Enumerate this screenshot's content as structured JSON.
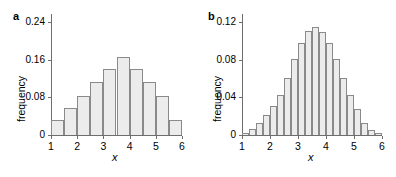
{
  "figure": {
    "background": "#ffffff",
    "bar_fill": "#ececec",
    "bar_stroke": "#8a8a8a",
    "axis_color": "#6e6e6e"
  },
  "panels": [
    {
      "key": "a",
      "label": "a",
      "xlabel": "x",
      "ylabel": "frequency"
    },
    {
      "key": "b",
      "label": "b",
      "xlabel": "x",
      "ylabel": "frequency"
    }
  ],
  "chart_data": [
    {
      "type": "bar",
      "panel": "a",
      "title": "a",
      "xlabel": "x",
      "ylabel": "frequency",
      "xlim": [
        1,
        6
      ],
      "ylim": [
        0,
        0.24
      ],
      "xticks": [
        1,
        2,
        3,
        4,
        5,
        6
      ],
      "xtick_labels": [
        "1",
        "2",
        "3",
        "4",
        "5",
        "6"
      ],
      "yticks": [
        0,
        0.08,
        0.16,
        0.24
      ],
      "ytick_labels": [
        "0",
        "0.08",
        "0.16",
        "0.24"
      ],
      "grid": false,
      "legend": null,
      "bin_width": 0.5,
      "bin_edges": [
        1.0,
        1.5,
        2.0,
        2.5,
        3.0,
        3.5,
        4.0,
        4.5,
        5.0,
        5.5,
        6.0
      ],
      "bin_centers": [
        1.25,
        1.75,
        2.25,
        2.75,
        3.25,
        3.75,
        4.25,
        4.75,
        5.25,
        5.75
      ],
      "categories": [
        "1.0-1.5",
        "1.5-2.0",
        "2.0-2.5",
        "2.5-3.0",
        "3.0-3.5",
        "3.5-4.0",
        "4.0-4.5",
        "4.5-5.0",
        "5.0-5.5",
        "5.5-6.0"
      ],
      "values": [
        0.032,
        0.057,
        0.082,
        0.112,
        0.141,
        0.166,
        0.141,
        0.112,
        0.082,
        0.032
      ]
    },
    {
      "type": "bar",
      "panel": "b",
      "title": "b",
      "xlabel": "x",
      "ylabel": "frequency",
      "xlim": [
        1,
        6
      ],
      "ylim": [
        0,
        0.12
      ],
      "xticks": [
        1,
        2,
        3,
        4,
        5,
        6
      ],
      "xtick_labels": [
        "1",
        "2",
        "3",
        "4",
        "5",
        "6"
      ],
      "yticks": [
        0,
        0.04,
        0.08,
        0.12
      ],
      "ytick_labels": [
        "0",
        "0.04",
        "0.08",
        "0.12"
      ],
      "grid": false,
      "legend": null,
      "bin_width": 0.25,
      "bin_edges": [
        1.0,
        1.25,
        1.5,
        1.75,
        2.0,
        2.25,
        2.5,
        2.75,
        3.0,
        3.25,
        3.5,
        3.75,
        4.0,
        4.25,
        4.5,
        4.75,
        5.0,
        5.25,
        5.5,
        5.75,
        6.0
      ],
      "bin_centers": [
        1.125,
        1.375,
        1.625,
        1.875,
        2.125,
        2.375,
        2.625,
        2.875,
        3.125,
        3.375,
        3.625,
        3.875,
        4.125,
        4.375,
        4.625,
        4.875,
        5.125,
        5.375,
        5.625,
        5.875
      ],
      "categories": [
        "1.00-1.25",
        "1.25-1.50",
        "1.50-1.75",
        "1.75-2.00",
        "2.00-2.25",
        "2.25-2.50",
        "2.50-2.75",
        "2.75-3.00",
        "3.00-3.25",
        "3.25-3.50",
        "3.50-3.75",
        "3.75-4.00",
        "4.00-4.25",
        "4.25-4.50",
        "4.50-4.75",
        "4.75-5.00",
        "5.00-5.25",
        "5.25-5.50",
        "5.50-5.75",
        "5.75-6.00"
      ],
      "values": [
        0.002,
        0.006,
        0.013,
        0.021,
        0.031,
        0.043,
        0.061,
        0.081,
        0.098,
        0.11,
        0.115,
        0.109,
        0.098,
        0.081,
        0.061,
        0.043,
        0.028,
        0.013,
        0.005,
        0.002
      ]
    }
  ]
}
